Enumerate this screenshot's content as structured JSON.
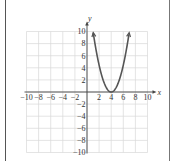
{
  "chart_data": {
    "type": "line",
    "title": "",
    "xlabel": "x",
    "ylabel": "y",
    "xlim": [
      -10,
      10
    ],
    "ylim": [
      -10,
      10
    ],
    "grid": true,
    "x_ticks": [
      -10,
      -8,
      -6,
      -4,
      -2,
      2,
      4,
      6,
      8,
      10
    ],
    "x_tick_labels": [
      "−10",
      "−8",
      "−6",
      "−4",
      "−2",
      "2",
      "4",
      "6",
      "8",
      "10"
    ],
    "y_ticks": [
      10,
      8,
      6,
      4,
      2,
      -2,
      -4,
      -6,
      -8,
      -10
    ],
    "y_tick_labels": [
      "10",
      "8",
      "6",
      "4",
      "2",
      "−2",
      "−4",
      "−6",
      "−8",
      "−10"
    ],
    "series": [
      {
        "name": "parabola",
        "description": "Upward-opening parabola with vertex at (4, 0), arrows at both ends",
        "equation_estimate": "y = (10/9)(x - 4)^2",
        "vertex": [
          4,
          0
        ],
        "x": [
          1,
          2,
          3,
          4,
          5,
          6,
          7
        ],
        "y": [
          10,
          4.4,
          1.1,
          0,
          1.1,
          4.4,
          10
        ],
        "color": "#555555"
      }
    ]
  },
  "colors": {
    "grid": "#d9d9d9",
    "axis": "#444444",
    "curve": "#555555",
    "border": "#666666"
  }
}
